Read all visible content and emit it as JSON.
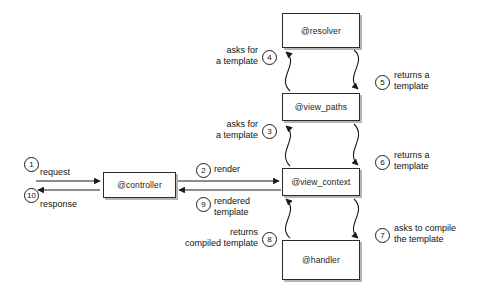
{
  "diagram": {
    "nodes": [
      {
        "id": "resolver",
        "label": "@resolver",
        "x": 282,
        "y": 13,
        "w": 78,
        "h": 35
      },
      {
        "id": "view_paths",
        "label": "@view_paths",
        "x": 282,
        "y": 93,
        "w": 78,
        "h": 28
      },
      {
        "id": "view_context",
        "label": "@view_context",
        "x": 282,
        "y": 168,
        "w": 78,
        "h": 28
      },
      {
        "id": "handler",
        "label": "@handler",
        "x": 282,
        "y": 240,
        "w": 78,
        "h": 40
      },
      {
        "id": "controller",
        "label": "@controller",
        "x": 103,
        "y": 172,
        "w": 73,
        "h": 26
      }
    ],
    "steps": [
      {
        "n": "1",
        "label": "request",
        "nx": 24,
        "ny": 157,
        "lx": 40,
        "ly": 167,
        "align": "l"
      },
      {
        "n": "2",
        "label": "render",
        "nx": 196,
        "ny": 163,
        "lx": 214,
        "ly": 164,
        "align": "l"
      },
      {
        "n": "3",
        "label": "asks for\na template",
        "nx": 262,
        "ny": 124,
        "lx": 190,
        "ly": 119,
        "align": "r"
      },
      {
        "n": "4",
        "label": "asks for\na template",
        "nx": 262,
        "ny": 50,
        "lx": 190,
        "ly": 45,
        "align": "r"
      },
      {
        "n": "5",
        "label": "returns a\ntemplate",
        "nx": 375,
        "ny": 75,
        "lx": 394,
        "ly": 70,
        "align": "l"
      },
      {
        "n": "6",
        "label": "returns a\ntemplate",
        "nx": 375,
        "ny": 155,
        "lx": 394,
        "ly": 150,
        "align": "l"
      },
      {
        "n": "7",
        "label": "asks to compile\nthe template",
        "nx": 375,
        "ny": 228,
        "lx": 394,
        "ly": 223,
        "align": "l"
      },
      {
        "n": "8",
        "label": "returns\ncompiled template",
        "nx": 262,
        "ny": 232,
        "lx": 176,
        "ly": 227,
        "align": "r"
      },
      {
        "n": "9",
        "label": "rendered\ntemplate",
        "nx": 196,
        "ny": 197,
        "lx": 214,
        "ly": 196,
        "align": "l"
      },
      {
        "n": "10",
        "label": "response",
        "nx": 24,
        "ny": 188,
        "lx": 40,
        "ly": 199,
        "align": "l"
      }
    ],
    "colors": {
      "stroke": "#1b1b1b",
      "node_fill": "#ffffff",
      "shadow": "#787878",
      "background": "#ffffff"
    }
  }
}
